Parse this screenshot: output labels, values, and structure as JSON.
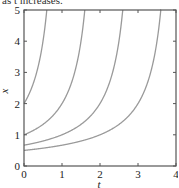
{
  "caption": "as t increases.",
  "chart_data": {
    "type": "line",
    "title": "",
    "xlabel": "t",
    "ylabel": "x",
    "xlim": [
      0,
      4
    ],
    "ylim": [
      0,
      5
    ],
    "xticks": [
      0,
      1,
      2,
      3,
      4
    ],
    "yticks": [
      0,
      1,
      2,
      3,
      4,
      5
    ],
    "grid": false,
    "legend": null,
    "line_color": "#9a9a9a",
    "series": [
      {
        "name": "x0=2",
        "x0": 2,
        "points": [
          [
            0,
            2.0
          ],
          [
            0.2,
            2.5
          ],
          [
            0.4,
            3.33
          ],
          [
            0.5,
            4.0
          ],
          [
            0.6,
            5.0
          ]
        ]
      },
      {
        "name": "x0=1",
        "x0": 1,
        "points": [
          [
            0,
            1.0
          ],
          [
            0.4,
            1.25
          ],
          [
            0.8,
            1.67
          ],
          [
            1.0,
            2.0
          ],
          [
            1.2,
            2.5
          ],
          [
            1.4,
            3.33
          ],
          [
            1.5,
            4.0
          ],
          [
            1.6,
            5.0
          ]
        ]
      },
      {
        "name": "x0=2/3",
        "x0": 0.667,
        "points": [
          [
            0,
            0.67
          ],
          [
            0.5,
            0.8
          ],
          [
            1.0,
            1.0
          ],
          [
            1.5,
            1.33
          ],
          [
            2.0,
            2.0
          ],
          [
            2.2,
            2.5
          ],
          [
            2.4,
            3.33
          ],
          [
            2.5,
            4.0
          ],
          [
            2.6,
            5.0
          ]
        ]
      },
      {
        "name": "x0=1/2",
        "x0": 0.5,
        "points": [
          [
            0,
            0.5
          ],
          [
            1.0,
            0.67
          ],
          [
            2.0,
            1.0
          ],
          [
            2.5,
            1.33
          ],
          [
            3.0,
            2.0
          ],
          [
            3.2,
            2.5
          ],
          [
            3.4,
            3.33
          ],
          [
            3.5,
            4.0
          ],
          [
            3.6,
            5.0
          ]
        ]
      }
    ]
  }
}
